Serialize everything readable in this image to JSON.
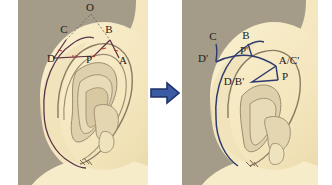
{
  "figure": {
    "type": "medical-illustration",
    "panel_count": 2,
    "transition_icon": "right-arrow-icon"
  },
  "colors": {
    "background": "#ffffff",
    "panel_backdrop": "#a49c88",
    "skin_fill": "#f6eac4",
    "skin_shadow": "#e6d6ae",
    "cartilage_fill": "#ded0ab",
    "outline": "#8a7a62",
    "marking_left": "#5c3348",
    "marking_tick": "#c0392b",
    "marking_right": "#2e3b6e",
    "arrow": "#3b5ba5",
    "arrow_outline": "#1f3269",
    "label_text": "#20201c"
  },
  "panels": [
    {
      "id": "panel-left",
      "name": "preoperative-diagram",
      "labels": [
        {
          "text": "O",
          "x": 72,
          "y": 11
        },
        {
          "text": "C",
          "x": 46,
          "y": 33
        },
        {
          "text": "B",
          "x": 91,
          "y": 33
        },
        {
          "text": "D",
          "x": 37,
          "y": 60
        },
        {
          "text": "P",
          "x": 71,
          "y": 60
        },
        {
          "text": "A",
          "x": 101,
          "y": 62
        }
      ]
    },
    {
      "id": "panel-right",
      "name": "postoperative-diagram",
      "labels": [
        {
          "text": "C",
          "x": 31,
          "y": 40
        },
        {
          "text": "B",
          "x": 63,
          "y": 39
        },
        {
          "text": "D'",
          "x": 22,
          "y": 60
        },
        {
          "text": "P'",
          "x": 61,
          "y": 58
        },
        {
          "text": "A/C'",
          "x": 86,
          "y": 63
        },
        {
          "text": "D/B'",
          "x": 45,
          "y": 80
        },
        {
          "text": "P",
          "x": 92,
          "y": 77
        }
      ]
    }
  ],
  "arrow": {
    "name": "transition-arrow",
    "direction": "right",
    "color": "#3b5ba5"
  }
}
